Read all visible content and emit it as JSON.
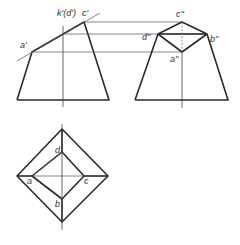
{
  "labels": {
    "front": {
      "a": "a'",
      "kd": "k'(d')",
      "c": "c'"
    },
    "side": {
      "c": "c''",
      "d": "d''",
      "b": "b''",
      "a": "a''"
    },
    "top": {
      "d": "d",
      "a": "a",
      "c": "c",
      "b": "b"
    }
  },
  "colors": {
    "line": "#2a2a2a",
    "thin": "#555555",
    "background": "#ffffff"
  }
}
